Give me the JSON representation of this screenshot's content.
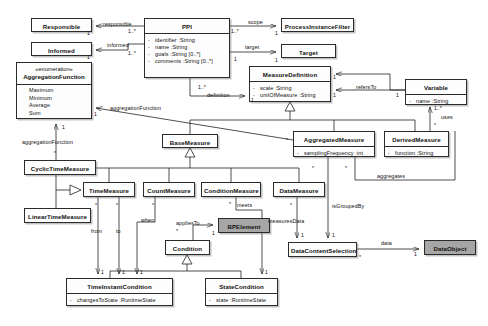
{
  "diagram": {
    "type": "uml-class-diagram",
    "colors": {
      "background": "#ffffff",
      "node_fill": "#fdfdfd",
      "shaded_node_fill": "#a6a6a6",
      "stroke": "#222222"
    }
  },
  "classes": [
    {
      "id": "responsible",
      "name": "Responsible",
      "shaded": false,
      "attributes": [],
      "x": 31,
      "y": 18,
      "w": 61,
      "h": 14
    },
    {
      "id": "informed",
      "name": "Informed",
      "shaded": false,
      "attributes": [],
      "x": 31,
      "y": 42,
      "w": 61,
      "h": 14
    },
    {
      "id": "aggregationFunction",
      "name": "AggregationFunction",
      "stereotype": "«enumeration»",
      "shaded": false,
      "literals": [
        "Maximum",
        "Minimum",
        "Average",
        "Sum"
      ],
      "x": 16,
      "y": 62,
      "w": 76,
      "h": 57
    },
    {
      "id": "ppi",
      "name": "PPI",
      "shaded": false,
      "attributes": [
        {
          "visibility": "-",
          "text": "identifier  :String"
        },
        {
          "visibility": "-",
          "text": "name  :String"
        },
        {
          "visibility": "-",
          "text": "goals  :String [0..*]"
        },
        {
          "visibility": "-",
          "text": "comments  :String [0..*]"
        }
      ],
      "x": 144,
      "y": 18,
      "w": 86,
      "h": 60
    },
    {
      "id": "processInstanceFilter",
      "name": "ProcessInstanceFilter",
      "shaded": false,
      "attributes": [],
      "x": 281,
      "y": 18,
      "w": 73,
      "h": 14
    },
    {
      "id": "target",
      "name": "Target",
      "shaded": false,
      "attributes": [],
      "x": 281,
      "y": 44,
      "w": 55,
      "h": 14
    },
    {
      "id": "measureDefinition",
      "name": "MeasureDefinition",
      "shaded": false,
      "attributes": [
        {
          "visibility": "-",
          "text": "scale  :String"
        },
        {
          "visibility": "-",
          "text": "unitOfMeasure  :String"
        }
      ],
      "x": 249,
      "y": 66,
      "w": 82,
      "h": 36
    },
    {
      "id": "variable",
      "name": "Variable",
      "shaded": false,
      "attributes": [
        {
          "visibility": "-",
          "text": "name  :String"
        }
      ],
      "x": 405,
      "y": 79,
      "w": 62,
      "h": 26
    },
    {
      "id": "aggregatedMeasure",
      "name": "AggregatedMeasure",
      "shaded": false,
      "attributes": [
        {
          "visibility": "-",
          "text": "samplingFrequency  :int"
        }
      ],
      "x": 293,
      "y": 131,
      "w": 82,
      "h": 26
    },
    {
      "id": "derivedMeasure",
      "name": "DerivedMeasure",
      "shaded": false,
      "attributes": [
        {
          "visibility": "-",
          "text": "function  :String"
        }
      ],
      "x": 384,
      "y": 131,
      "w": 65,
      "h": 26
    },
    {
      "id": "baseMeasure",
      "name": "BaseMeasure",
      "shaded": false,
      "attributes": [],
      "x": 162,
      "y": 134,
      "w": 56,
      "h": 14
    },
    {
      "id": "cyclicTimeMeasure",
      "name": "CyclicTimeMeasure",
      "shaded": false,
      "attributes": [],
      "x": 24,
      "y": 160,
      "w": 72,
      "h": 15
    },
    {
      "id": "timeMeasure",
      "name": "TimeMeasure",
      "shaded": false,
      "attributes": [],
      "x": 83,
      "y": 182,
      "w": 52,
      "h": 15
    },
    {
      "id": "linearTimeMeasure",
      "name": "LinearTimeMeasure",
      "shaded": false,
      "attributes": [],
      "x": 24,
      "y": 208,
      "w": 67,
      "h": 15
    },
    {
      "id": "countMeasure",
      "name": "CountMeasure",
      "shaded": false,
      "attributes": [],
      "x": 143,
      "y": 182,
      "w": 52,
      "h": 15
    },
    {
      "id": "conditionMeasure",
      "name": "ConditionMeasure",
      "shaded": false,
      "attributes": [],
      "x": 201,
      "y": 182,
      "w": 60,
      "h": 15
    },
    {
      "id": "dataMeasure",
      "name": "DataMeasure",
      "shaded": false,
      "attributes": [],
      "x": 273,
      "y": 182,
      "w": 52,
      "h": 15
    },
    {
      "id": "bpElement",
      "name": "BPElement",
      "shaded": true,
      "attributes": [],
      "x": 218,
      "y": 218,
      "w": 52,
      "h": 15
    },
    {
      "id": "condition",
      "name": "Condition",
      "shaded": false,
      "attributes": [],
      "x": 165,
      "y": 240,
      "w": 45,
      "h": 15
    },
    {
      "id": "dataContentSelection",
      "name": "DataContentSelection",
      "shaded": false,
      "attributes": [],
      "x": 288,
      "y": 242,
      "w": 69,
      "h": 15
    },
    {
      "id": "dataObject",
      "name": "DataObject",
      "shaded": true,
      "attributes": [],
      "x": 424,
      "y": 240,
      "w": 52,
      "h": 15
    },
    {
      "id": "timeInstantCondition",
      "name": "TimeInstantCondition",
      "shaded": false,
      "attributes": [
        {
          "visibility": "-",
          "text": "changesToState  :RuntimeState"
        }
      ],
      "x": 66,
      "y": 278,
      "w": 107,
      "h": 28
    },
    {
      "id": "stateCondition",
      "name": "StateCondition",
      "shaded": false,
      "attributes": [
        {
          "visibility": "-",
          "text": "state  :RuntimeState"
        }
      ],
      "x": 205,
      "y": 278,
      "w": 73,
      "h": 28
    }
  ],
  "edge_labels": [
    {
      "id": "lbl-responsible",
      "text": "responsible",
      "x": 103,
      "y": 21
    },
    {
      "id": "lbl-informed",
      "text": "informed",
      "x": 107,
      "y": 42
    },
    {
      "id": "lbl-scope",
      "text": "scope",
      "x": 248,
      "y": 19
    },
    {
      "id": "lbl-target",
      "text": "target",
      "x": 245,
      "y": 44
    },
    {
      "id": "lbl-definition",
      "text": "definition",
      "x": 207,
      "y": 92
    },
    {
      "id": "lbl-refersTo",
      "text": "refersTo",
      "x": 356,
      "y": 84
    },
    {
      "id": "lbl-uses",
      "text": "uses",
      "x": 441,
      "y": 114
    },
    {
      "id": "lbl-aggregationFunction-1",
      "text": "aggregationFunction",
      "x": 110,
      "y": 105
    },
    {
      "id": "lbl-aggregationFunction-2",
      "text": "aggregationFunction",
      "x": 22,
      "y": 139
    },
    {
      "id": "lbl-aggregates",
      "text": "aggregates",
      "x": 377,
      "y": 173
    },
    {
      "id": "lbl-from",
      "text": "from",
      "x": 97,
      "y": 228
    },
    {
      "id": "lbl-to",
      "text": "to",
      "x": 118,
      "y": 228
    },
    {
      "id": "lbl-when",
      "text": "when",
      "x": 144,
      "y": 217
    },
    {
      "id": "lbl-appliesTo",
      "text": "appliesTo",
      "x": 180,
      "y": 220
    },
    {
      "id": "lbl-meets",
      "text": "meets",
      "x": 240,
      "y": 203
    },
    {
      "id": "lbl-measuresData",
      "text": "measuresData",
      "x": 283,
      "y": 218
    },
    {
      "id": "lbl-isGroupedBy",
      "text": "isGroupedBy",
      "x": 330,
      "y": 203
    },
    {
      "id": "lbl-data",
      "text": "data",
      "x": 385,
      "y": 240
    }
  ],
  "multiplicities": [
    {
      "id": "m-resp-1",
      "text": "1",
      "x": 87,
      "y": 30
    },
    {
      "id": "m-ppi-resp",
      "text": "1..*",
      "x": 131,
      "y": 28
    },
    {
      "id": "m-inf-1",
      "text": "1",
      "x": 87,
      "y": 54
    },
    {
      "id": "m-ppi-inf",
      "text": "1..*",
      "x": 131,
      "y": 50
    },
    {
      "id": "m-ppi-scope",
      "text": "1..*",
      "x": 232,
      "y": 27
    },
    {
      "id": "m-pif-1",
      "text": "1",
      "x": 274,
      "y": 30
    },
    {
      "id": "m-ppi-target",
      "text": "1",
      "x": 234,
      "y": 56
    },
    {
      "id": "m-target-1",
      "text": "1",
      "x": 274,
      "y": 57
    },
    {
      "id": "m-ppi-def",
      "text": "1..*",
      "x": 200,
      "y": 84
    },
    {
      "id": "m-md-def",
      "text": "1",
      "x": 250,
      "y": 98
    },
    {
      "id": "m-md-refers",
      "text": "1",
      "x": 334,
      "y": 75
    },
    {
      "id": "m-md-refers2",
      "text": "1",
      "x": 334,
      "y": 93
    },
    {
      "id": "m-var-refers",
      "text": "1",
      "x": 396,
      "y": 92
    },
    {
      "id": "m-var-uses",
      "text": "1..*",
      "x": 434,
      "y": 106
    },
    {
      "id": "m-dm-uses",
      "text": "*",
      "x": 434,
      "y": 123
    },
    {
      "id": "m-aggfn-1",
      "text": "1",
      "x": 94,
      "y": 112
    },
    {
      "id": "m-aggfn-2",
      "text": "1",
      "x": 65,
      "y": 124
    },
    {
      "id": "m-cyclic-aggfn",
      "text": "*",
      "x": 57,
      "y": 150
    },
    {
      "id": "m-am-base",
      "text": "*",
      "x": 286,
      "y": 137
    },
    {
      "id": "m-am-agg1",
      "text": "*",
      "x": 312,
      "y": 166
    },
    {
      "id": "m-am-agg2",
      "text": "*",
      "x": 345,
      "y": 166
    },
    {
      "id": "m-tm-from",
      "text": "*",
      "x": 97,
      "y": 203
    },
    {
      "id": "m-tm-to",
      "text": "*",
      "x": 118,
      "y": 203
    },
    {
      "id": "m-cm-when",
      "text": "*",
      "x": 154,
      "y": 203
    },
    {
      "id": "m-cond-applies",
      "text": "*",
      "x": 177,
      "y": 228
    },
    {
      "id": "m-bpel-1",
      "text": "1",
      "x": 212,
      "y": 230
    },
    {
      "id": "m-condm-meets",
      "text": "*",
      "x": 230,
      "y": 202
    },
    {
      "id": "m-dm-measures",
      "text": "*",
      "x": 290,
      "y": 203
    },
    {
      "id": "m-dcs-1",
      "text": "1",
      "x": 300,
      "y": 233
    },
    {
      "id": "m-dcs-2",
      "text": "1",
      "x": 331,
      "y": 233
    },
    {
      "id": "m-dcs-data",
      "text": "*",
      "x": 360,
      "y": 255
    },
    {
      "id": "m-do-1",
      "text": "1",
      "x": 413,
      "y": 252
    },
    {
      "id": "m-tic-1",
      "text": "1",
      "x": 101,
      "y": 270
    },
    {
      "id": "m-tic-2",
      "text": "1",
      "x": 122,
      "y": 270
    },
    {
      "id": "m-tic-3",
      "text": "1",
      "x": 140,
      "y": 270
    },
    {
      "id": "m-sc-1",
      "text": "1",
      "x": 271,
      "y": 270
    }
  ]
}
